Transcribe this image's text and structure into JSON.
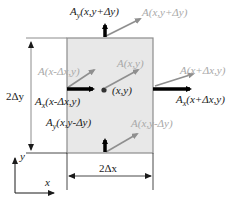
{
  "diagram": {
    "title": "",
    "colors": {
      "cell_fill": "#e8e8e8",
      "cell_border": "#8c8c8c",
      "component_arrow": "#000000",
      "vector_arrow": "#8f8f8f",
      "vector_label": "#a8a8a8",
      "text": "#1a1a1a"
    },
    "labels": {
      "top_component": "A_y(x,y+Δy)",
      "top_component_main": "A",
      "top_component_sub": "y",
      "top_component_args": "(x,y+Δy)",
      "top_vector": "A(x,y+Δy)",
      "left_vector": "A(x-Δx,y)",
      "center_vector": "A(x,y)",
      "right_vector": "A(x+Δx,y)",
      "center_point": "(x,y)",
      "left_component_main": "A",
      "left_component_sub": "x",
      "left_component_args": "(x-Δx,y)",
      "right_component_main": "A",
      "right_component_sub": "x",
      "right_component_args": "(x+Δx,y)",
      "bottom_component_main": "A",
      "bottom_component_sub": "y",
      "bottom_component_args": "(x,y-Δy)",
      "bottom_vector": "A(x,y-Δy)",
      "height_dim": "2Δy",
      "width_dim": "2Δx"
    },
    "axes": {
      "x_label": "x",
      "y_label": "y"
    }
  }
}
